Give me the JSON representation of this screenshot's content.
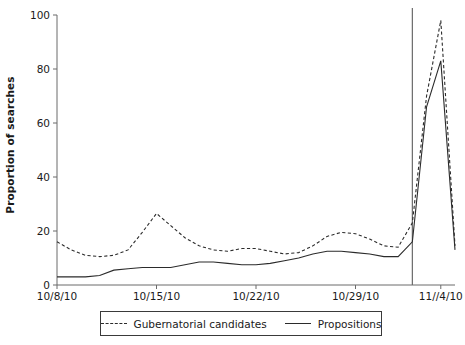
{
  "chart_data": {
    "type": "line",
    "title": "",
    "xlabel": "",
    "ylabel": "Proportion of searches",
    "ylim": [
      0,
      100
    ],
    "yticks": [
      0,
      20,
      40,
      60,
      80,
      100
    ],
    "ytick_labels": [
      "0",
      "20",
      "40",
      "60",
      "80",
      "100"
    ],
    "xlim": [
      "10/8/10",
      "11/5/10"
    ],
    "xticks": [
      "10/8/10",
      "10/15/10",
      "10/22/10",
      "10/29/10",
      "11//4/10"
    ],
    "xtick_labels": [
      "10/8/10",
      "10/15/10",
      "10/22/10",
      "10/29/10",
      "11//4/10"
    ],
    "grid": false,
    "legend_position": "bottom-center",
    "x": [
      "10/8/10",
      "10/9/10",
      "10/10/10",
      "10/11/10",
      "10/12/10",
      "10/13/10",
      "10/14/10",
      "10/15/10",
      "10/16/10",
      "10/17/10",
      "10/18/10",
      "10/19/10",
      "10/20/10",
      "10/21/10",
      "10/22/10",
      "10/23/10",
      "10/24/10",
      "10/25/10",
      "10/26/10",
      "10/27/10",
      "10/28/10",
      "10/29/10",
      "10/30/10",
      "10/31/10",
      "11/1/10",
      "11/2/10",
      "11/3/10",
      "11/4/10",
      "11/5/10"
    ],
    "series": [
      {
        "name": "Gubernatorial candidates",
        "style": "dashed",
        "color": "#2b2b2b",
        "values": [
          16,
          13,
          11,
          10.5,
          11,
          13,
          19.5,
          26.5,
          22,
          17.5,
          14.5,
          13,
          12.5,
          13.5,
          13.5,
          12.5,
          11.5,
          12,
          14.5,
          18,
          19.5,
          19,
          17,
          14.5,
          14,
          23,
          70,
          98,
          14.5
        ]
      },
      {
        "name": "Propositions",
        "style": "solid",
        "color": "#2b2b2b",
        "values": [
          3,
          3,
          3,
          3.5,
          5.5,
          6,
          6.5,
          6.5,
          6.5,
          7.5,
          8.5,
          8.5,
          8,
          7.5,
          7.5,
          8,
          9,
          10,
          11.5,
          12.5,
          12.5,
          12,
          11.5,
          10.5,
          10.5,
          16,
          66,
          83,
          13
        ]
      }
    ],
    "reference_line": {
      "name": "election-day",
      "x": "11/2/10",
      "color": "#6a6a6a"
    }
  },
  "legend": {
    "entries": [
      {
        "label": "Gubernatorial candidates",
        "style": "dashed"
      },
      {
        "label": "Propositions",
        "style": "solid"
      }
    ]
  }
}
